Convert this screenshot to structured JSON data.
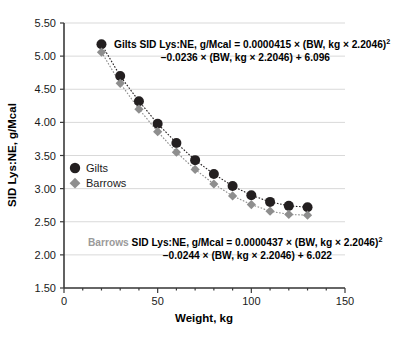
{
  "chart_data": {
    "type": "scatter",
    "title": "",
    "xlabel": "Weight, kg",
    "ylabel": "SID Lys:NE, g/Mcal",
    "xlim": [
      0,
      150
    ],
    "ylim": [
      1.5,
      5.5
    ],
    "xticks": [
      0,
      50,
      100,
      150
    ],
    "xtick_labels": [
      "0",
      "50",
      "100",
      "150"
    ],
    "xminor_ticks": [
      10,
      20,
      30,
      40,
      60,
      70,
      80,
      90,
      110,
      120,
      130,
      140
    ],
    "yticks": [
      1.5,
      2.0,
      2.5,
      3.0,
      3.5,
      4.0,
      4.5,
      5.0,
      5.5
    ],
    "ytick_labels": [
      "1.50",
      "2.00",
      "2.50",
      "3.00",
      "3.50",
      "4.00",
      "4.50",
      "5.00",
      "5.50"
    ],
    "grid": true,
    "grid_axis": "y",
    "legend_position": "inside-left",
    "x": [
      20,
      30,
      40,
      50,
      60,
      70,
      80,
      90,
      100,
      110,
      120,
      130
    ],
    "series": [
      {
        "name": "Gilts",
        "marker": "circle",
        "color": "#231f20",
        "line_style": "dotted",
        "values": [
          5.18,
          4.7,
          4.32,
          3.98,
          3.69,
          3.43,
          3.22,
          3.04,
          2.9,
          2.8,
          2.74,
          2.72
        ]
      },
      {
        "name": "Barrows",
        "marker": "diamond",
        "color": "#8e8e8e",
        "line_style": "dotted",
        "values": [
          5.06,
          4.59,
          4.2,
          3.86,
          3.55,
          3.29,
          3.07,
          2.89,
          2.76,
          2.66,
          2.61,
          2.6
        ]
      }
    ],
    "annotations": [
      {
        "id": "gilts-equation",
        "color": "#000000",
        "prefix_label": "Gilts",
        "prefix_color": "#000000",
        "line1": "Gilts SID Lys:NE, g/Mcal = 0.0000415 × (BW, kg × 2.2046)",
        "line1_sup": "2",
        "line2": "−0.0236 × (BW, kg × 2.2046) + 6.096"
      },
      {
        "id": "barrows-equation",
        "color": "#000000",
        "prefix_label": "Barrows",
        "prefix_color": "#9a9a9a",
        "line1": " SID Lys:NE, g/Mcal = 0.0000437 × (BW, kg × 2.2046)",
        "line1_sup": "2",
        "line2": "−0.0244 × (BW, kg × 2.2046) + 6.022"
      }
    ]
  },
  "legend": {
    "items": [
      {
        "label": "Gilts",
        "marker": "circle",
        "color": "#231f20"
      },
      {
        "label": "Barrows",
        "marker": "diamond",
        "color": "#8e8e8e"
      }
    ]
  },
  "axes": {
    "x_title": "Weight, kg",
    "y_title": "SID Lys:NE, g/Mcal"
  }
}
